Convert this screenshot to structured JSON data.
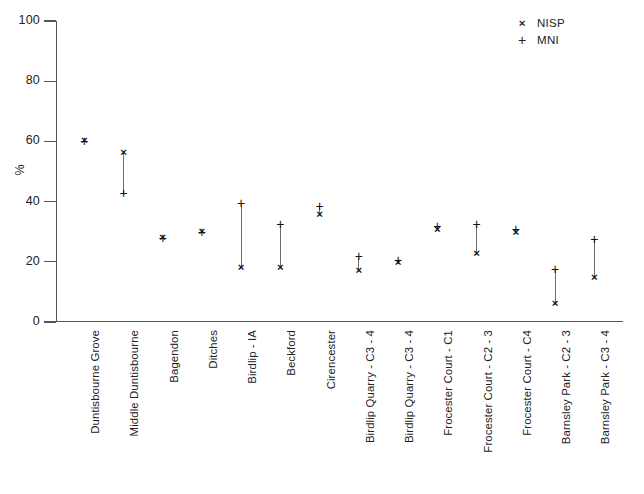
{
  "chart_data": {
    "type": "scatter",
    "title": "",
    "xlabel": "",
    "ylabel": "%",
    "ylim": [
      0,
      100
    ],
    "yticks": [
      0,
      20,
      40,
      60,
      80,
      100
    ],
    "grid": false,
    "legend_position": "top-right",
    "categories": [
      "Duntisbourne Grove",
      "Middle Duntisbourne",
      "Bagendon",
      "Ditches",
      "Birdlip - IA",
      "Beckford",
      "Cirencester",
      "Birdlip Quarry - C3 - 4",
      "Birdlip Quarry - C3 - 4",
      "Frocester Court - C1",
      "Frocester Court - C2 - 3",
      "Frocester Court - C4",
      "Barnsley Park - C2 - 3",
      "Barnsley Park - C3 - 4"
    ],
    "series": [
      {
        "name": "NISP",
        "marker": "x",
        "values": [
          60,
          56,
          28,
          30,
          18,
          18,
          35.5,
          17,
          19.5,
          30.5,
          22.5,
          29.5,
          6,
          14.5
        ]
      },
      {
        "name": "MNI",
        "marker": "+",
        "values": [
          60,
          43,
          28,
          30,
          39.5,
          32.5,
          38.5,
          22,
          20.5,
          32,
          32.5,
          31,
          17.5,
          27.5
        ]
      }
    ],
    "annotations": []
  },
  "legend": {
    "entries": [
      {
        "glyph": "×",
        "label": "NISP"
      },
      {
        "glyph": "+",
        "label": "MNI"
      }
    ]
  },
  "axis": {
    "y_title": "%",
    "y_tick_labels": [
      "0",
      "20",
      "40",
      "60",
      "80",
      "100"
    ]
  }
}
